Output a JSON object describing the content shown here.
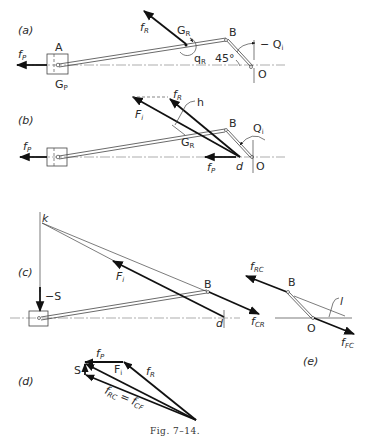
{
  "figure": {
    "caption": "Fig. 7–14.",
    "header_text": ""
  },
  "panel_a": {
    "label": "(a)",
    "points": {
      "A": "A",
      "B": "B",
      "O": "O"
    },
    "forces": {
      "fP": "f",
      "fP_sub": "P",
      "fR": "f",
      "fR_sub": "R"
    },
    "GP": "G",
    "GP_sub": "P",
    "GR": "G",
    "GR_sub": "R",
    "qR": "q",
    "qR_sub": "R",
    "Qi": "− Q",
    "Qi_sub": "i",
    "angle": "45°"
  },
  "panel_b": {
    "label": "(b)",
    "points": {
      "B": "B",
      "O": "O",
      "d": "d"
    },
    "forces": {
      "fP": "f",
      "fP_sub": "P",
      "fP2": "f",
      "fP2_sub": "P",
      "fR": "f",
      "fR_sub": "R",
      "Fi": "F",
      "Fi_sub": "i"
    },
    "h": "h",
    "GR": "G",
    "GR_sub": "R",
    "Qi": "Q",
    "Qi_sub": "i"
  },
  "panel_c": {
    "label": "(c)",
    "points": {
      "k": "k",
      "B": "B",
      "d": "d"
    },
    "S": "−S",
    "Fi": "F",
    "Fi_sub": "i",
    "fCR": "f",
    "fCR_sub": "CR"
  },
  "panel_d": {
    "label": "(d)",
    "S": "S",
    "fP": "f",
    "fP_sub": "P",
    "Fi": "F",
    "Fi_sub": "i",
    "fR": "f",
    "fR_sub": "R",
    "fRC": "f",
    "fRC_sub": "RC",
    "eq": "=",
    "fCF": "f",
    "fCF_sub": "CF"
  },
  "panel_e": {
    "label": "(e)",
    "points": {
      "B": "B",
      "O": "O"
    },
    "fRC": "f",
    "fRC_sub": "RC",
    "fFC": "f",
    "fFC_sub": "FC",
    "l": "l"
  }
}
